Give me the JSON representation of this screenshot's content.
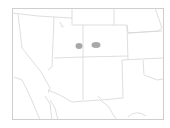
{
  "map": {
    "region": "Southwestern United States",
    "colors": {
      "background": "#ffffff",
      "border": "#d6d6d6",
      "frame": "#cfcfcf",
      "marker": "#999999"
    },
    "markers": [
      {
        "label": "marker-1",
        "cx": 79,
        "cy": 46,
        "rx": 3.5,
        "ry": 3
      },
      {
        "label": "marker-2",
        "cx": 96,
        "cy": 45,
        "rx": 4.5,
        "ry": 3
      }
    ]
  }
}
